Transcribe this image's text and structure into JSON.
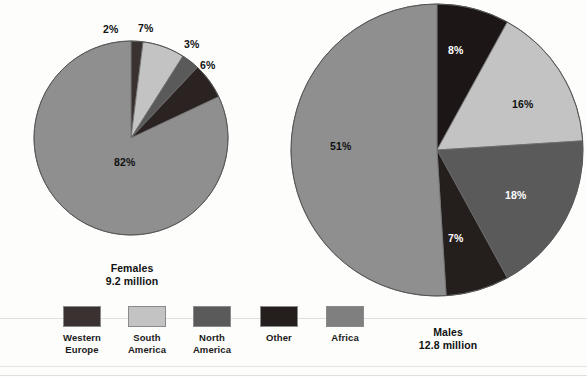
{
  "figure": {
    "background_color": "#fdfdfc",
    "charts": [
      {
        "id": "females",
        "caption_line1": "Females",
        "caption_line2": "9.2 million",
        "center_x": 131,
        "center_y": 138,
        "radius": 97,
        "caption_left": 62,
        "caption_top": 262,
        "caption_width": 140
      },
      {
        "id": "males",
        "caption_line1": "Males",
        "caption_line2": "12.8 million",
        "center_x": 437,
        "center_y": 150,
        "radius": 146,
        "caption_left": 378,
        "caption_top": 326,
        "caption_width": 140
      }
    ]
  },
  "chart_data": [
    {
      "type": "pie",
      "title": "Females",
      "subtitle": "9.2 million",
      "total_label": "9.2 million",
      "start_angle_deg": 0,
      "direction": "clockwise",
      "categories": [
        "Western Europe",
        "South America",
        "North America",
        "Other",
        "Africa"
      ],
      "values": [
        2,
        7,
        3,
        6,
        82
      ],
      "value_labels": [
        "2%",
        "7%",
        "3%",
        "6%",
        "82%"
      ],
      "colors": [
        "#3a3230",
        "#c3c3c3",
        "#5a5a5a",
        "#2a2322",
        "#8f8f8f"
      ],
      "label_text_colors": [
        "#111111",
        "#111111",
        "#111111",
        "#111111",
        "#111111"
      ],
      "units": "percent"
    },
    {
      "type": "pie",
      "title": "Males",
      "subtitle": "12.8 million",
      "total_label": "12.8 million",
      "start_angle_deg": 0,
      "direction": "clockwise",
      "categories": [
        "Western Europe",
        "South America",
        "North America",
        "Other",
        "Africa"
      ],
      "values": [
        8,
        16,
        18,
        7,
        51
      ],
      "value_labels": [
        "8%",
        "16%",
        "18%",
        "7%",
        "51%"
      ],
      "colors": [
        "#1c1716",
        "#c3c3c3",
        "#5a5a5a",
        "#241e1d",
        "#8f8f8f"
      ],
      "label_text_colors": [
        "#ffffff",
        "#111111",
        "#ffffff",
        "#ffffff",
        "#111111"
      ],
      "units": "percent"
    }
  ],
  "labels": {
    "females": [
      {
        "text": "2%",
        "x": 103,
        "y": 24,
        "tone": "dark"
      },
      {
        "text": "7%",
        "x": 138,
        "y": 23,
        "tone": "dark"
      },
      {
        "text": "3%",
        "x": 184,
        "y": 39,
        "tone": "dark"
      },
      {
        "text": "6%",
        "x": 200,
        "y": 60,
        "tone": "dark"
      },
      {
        "text": "82%",
        "x": 114,
        "y": 157,
        "tone": "dark"
      }
    ],
    "males": [
      {
        "text": "8%",
        "x": 448,
        "y": 45,
        "tone": "light"
      },
      {
        "text": "16%",
        "x": 512,
        "y": 99,
        "tone": "dark"
      },
      {
        "text": "18%",
        "x": 505,
        "y": 190,
        "tone": "light"
      },
      {
        "text": "7%",
        "x": 448,
        "y": 233,
        "tone": "light"
      },
      {
        "text": "51%",
        "x": 330,
        "y": 141,
        "tone": "dark"
      }
    ]
  },
  "legend": {
    "items": [
      {
        "label": "Western\nEurope",
        "color": "#3a3230",
        "left": 50,
        "name": "western-europe"
      },
      {
        "label": "South\nAmerica",
        "color": "#c3c3c3",
        "left": 115,
        "name": "south-america"
      },
      {
        "label": "North\nAmerica",
        "color": "#5a5a5a",
        "left": 180,
        "name": "north-america"
      },
      {
        "label": "Other",
        "color": "#241e1d",
        "left": 247,
        "name": "other"
      },
      {
        "label": "Africa",
        "color": "#7f7f7f",
        "left": 313,
        "name": "africa"
      }
    ]
  },
  "scanlines": [
    {
      "top": 318
    },
    {
      "top": 366
    },
    {
      "top": 375
    }
  ]
}
